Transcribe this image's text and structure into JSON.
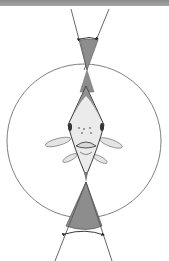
{
  "figure": {
    "type": "diagram",
    "elements": {
      "header_bar": {
        "color": "#999999"
      },
      "visual_field_circle": {
        "cx": 84,
        "cy": 141,
        "r": 77,
        "stroke": "#6e6e6e"
      },
      "front_binocular_zone": {
        "fill": "#8f8f8f",
        "label": ""
      },
      "rear_blind_zone": {
        "fill": "#8f8f8f",
        "label": ""
      },
      "fish": {
        "view": "top/front",
        "body_fill": "#e9e9e9",
        "outline": "#444444"
      },
      "angle_arrows": [
        "top",
        "bottom"
      ]
    }
  }
}
